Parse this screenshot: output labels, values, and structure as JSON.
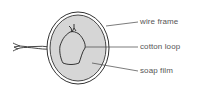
{
  "diagram": {
    "labels": {
      "wire_frame": "wire frame",
      "cotton_loop": "cotton loop",
      "soap_film": "soap film"
    },
    "colors": {
      "film_fill": "#d6d6d6",
      "line": "#333333",
      "label_text": "#555555"
    }
  }
}
